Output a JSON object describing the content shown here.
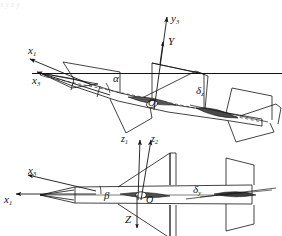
{
  "figure": {
    "stroke_color": "#141414",
    "fill_color": "#5d5d5d",
    "background": "#ffffff",
    "top_cropped_text": "x   y   z   y"
  },
  "upper_view": {
    "name": "pitch-plane-view",
    "description": "Missile shown in pitch plane with angle of attack",
    "labels": {
      "axis_y3": "y",
      "axis_y3_sub": "3",
      "force_Y": "Y",
      "axis_x1": "x",
      "axis_x1_sub": "1",
      "axis_x3": "x",
      "axis_x3_sub": "3",
      "angle_alpha": "α",
      "origin": "O",
      "deflection": "δ",
      "deflection_sub": "z"
    }
  },
  "lower_view": {
    "name": "yaw-plane-view",
    "description": "Missile shown in yaw plane with sideslip angle",
    "labels": {
      "axis_z1": "z",
      "axis_z1_sub": "1",
      "axis_z2": "z",
      "axis_z2_sub": "2",
      "force_Z": "Z",
      "axis_x3": "x",
      "axis_x3_sub": "3",
      "axis_x1": "x",
      "axis_x1_sub": "1",
      "angle_beta": "β",
      "origin": "O",
      "deflection": "δ",
      "deflection_sub": "y"
    }
  }
}
